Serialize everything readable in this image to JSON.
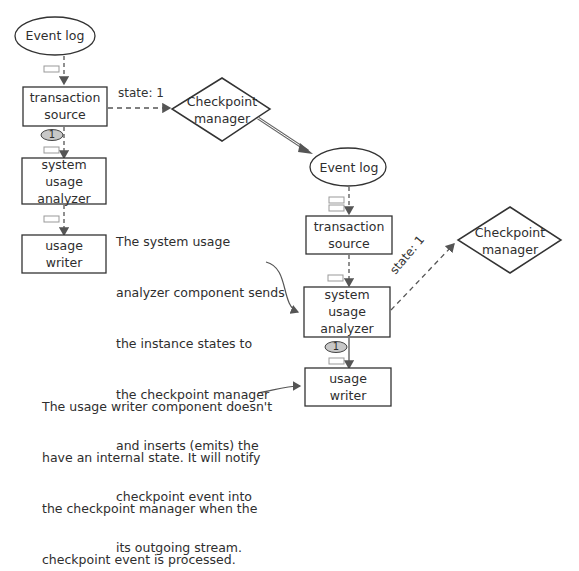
{
  "diagram": {
    "left": {
      "event_log": "Event log",
      "transaction_source": [
        "transaction",
        "source"
      ],
      "checkpoint_manager": [
        "Checkpoint",
        "manager"
      ],
      "state_label": "state: 1",
      "barrier_label": "1",
      "system_usage_analyzer": [
        "system",
        "usage",
        "analyzer"
      ],
      "usage_writer": [
        "usage",
        "writer"
      ]
    },
    "right": {
      "event_log": "Event log",
      "transaction_source": [
        "transaction",
        "source"
      ],
      "checkpoint_manager": [
        "Checkpoint",
        "manager"
      ],
      "state_label": "state: 1",
      "barrier_label": "1",
      "system_usage_analyzer": [
        "system",
        "usage",
        "analyzer"
      ],
      "usage_writer": [
        "usage",
        "writer"
      ]
    },
    "notes": {
      "analyzer_note": [
        "The system usage",
        "analyzer component sends",
        "the instance states to",
        "the checkpoint manager",
        "and inserts (emits) the",
        "checkpoint event into",
        "its outgoing stream."
      ],
      "writer_note": [
        "The usage writer component doesn't",
        "have an internal state. It will notify",
        "the checkpoint manager when the",
        "checkpoint event is processed."
      ]
    },
    "colors": {
      "stroke": "#3a3a3a",
      "barrier_fill": "#c8c8c8",
      "event_box": "#ffffff"
    }
  }
}
